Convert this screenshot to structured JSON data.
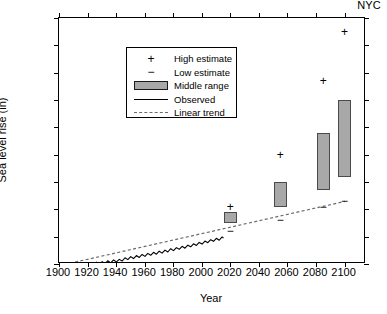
{
  "corner_label": "NYC",
  "axes": {
    "xlabel": "Year",
    "ylabel": "Sea level rise (in)",
    "xticks": [
      1900,
      1920,
      1940,
      1960,
      1980,
      2000,
      2020,
      2040,
      2060,
      2080,
      2100
    ],
    "yticks": [
      -10,
      0,
      10,
      20,
      30,
      40,
      50,
      60,
      70,
      80
    ],
    "xlim": [
      1900,
      2115
    ],
    "ylim": [
      -10,
      80
    ]
  },
  "legend": {
    "items": [
      {
        "label": "High estimate",
        "marker": "plus-marker",
        "color": "#000000"
      },
      {
        "label": "Low estimate",
        "marker": "minus-marker",
        "color": "#000000"
      },
      {
        "label": "Middle range",
        "marker": "filled-box",
        "color": "#a8a8a8"
      },
      {
        "label": "Observed",
        "marker": "solid-line",
        "color": "#000000"
      },
      {
        "label": "Linear trend",
        "marker": "dashed-line",
        "color": "#6b6b6b"
      }
    ]
  },
  "chart_data": {
    "type": "line",
    "title": "NYC",
    "xlabel": "Year",
    "ylabel": "Sea level rise (in)",
    "xlim": [
      1900,
      2115
    ],
    "ylim": [
      -10,
      80
    ],
    "grid": false,
    "legend_position": "upper-left",
    "series": [
      {
        "name": "Observed",
        "type": "line",
        "color": "#000000",
        "x": [
          1900,
          1902,
          1904,
          1906,
          1908,
          1910,
          1912,
          1914,
          1916,
          1918,
          1920,
          1922,
          1924,
          1926,
          1928,
          1930,
          1932,
          1934,
          1936,
          1938,
          1940,
          1942,
          1944,
          1946,
          1948,
          1950,
          1952,
          1954,
          1956,
          1958,
          1960,
          1962,
          1964,
          1966,
          1968,
          1970,
          1972,
          1974,
          1976,
          1978,
          1980,
          1982,
          1984,
          1986,
          1988,
          1990,
          1992,
          1994,
          1996,
          1998,
          2000,
          2002,
          2004,
          2006,
          2008,
          2010,
          2012,
          2014,
          2015
        ],
        "values": [
          -11.0,
          -10.4,
          -11.2,
          -10.2,
          -11.0,
          -10.1,
          -10.8,
          -9.8,
          -10.6,
          -9.5,
          -10.3,
          -9.4,
          -10.1,
          -9.2,
          -10.4,
          -9.0,
          -9.8,
          -8.7,
          -9.5,
          -8.4,
          -9.1,
          -8.2,
          -8.8,
          -7.6,
          -8.3,
          -7.2,
          -7.9,
          -6.8,
          -7.5,
          -6.4,
          -7.1,
          -6.0,
          -6.7,
          -5.6,
          -6.3,
          -5.2,
          -5.9,
          -4.8,
          -5.5,
          -4.3,
          -5.0,
          -3.9,
          -4.5,
          -3.4,
          -4.1,
          -3.0,
          -3.6,
          -2.5,
          -3.1,
          -2.0,
          -2.6,
          -1.5,
          -2.1,
          -1.0,
          -1.6,
          -0.5,
          -1.2,
          0.0,
          -0.4
        ]
      },
      {
        "name": "Linear trend",
        "type": "line",
        "style": "dashed",
        "color": "#6b6b6b",
        "x": [
          1900,
          2100
        ],
        "values": [
          -10.5,
          13.0
        ]
      }
    ],
    "projections": [
      {
        "year": 2020,
        "low": 2,
        "mid_low": 5,
        "mid_high": 9,
        "high": 11
      },
      {
        "year": 2055,
        "low": 6,
        "mid_low": 11,
        "mid_high": 20,
        "high": 30
      },
      {
        "year": 2085,
        "low": 11,
        "mid_low": 17,
        "mid_high": 38,
        "high": 57
      },
      {
        "year": 2100,
        "low": 13,
        "mid_low": 22,
        "mid_high": 50,
        "high": 75
      }
    ],
    "projection_bar_color": "#a8a8a8"
  }
}
